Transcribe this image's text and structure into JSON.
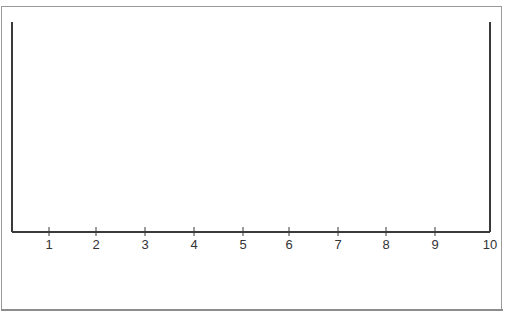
{
  "diagram": {
    "type": "number-line",
    "ticks": [
      {
        "label": "1",
        "x": 49
      },
      {
        "label": "2",
        "x": 96
      },
      {
        "label": "3",
        "x": 145
      },
      {
        "label": "4",
        "x": 194
      },
      {
        "label": "5",
        "x": 243
      },
      {
        "label": "6",
        "x": 289
      },
      {
        "label": "7",
        "x": 338
      },
      {
        "label": "8",
        "x": 386
      },
      {
        "label": "9",
        "x": 435
      },
      {
        "label": "10",
        "x": 490
      }
    ],
    "colors": {
      "axis": "#3a3a3a",
      "frame": "#9a9a9a",
      "label": "#333333",
      "background": "#ffffff"
    }
  }
}
